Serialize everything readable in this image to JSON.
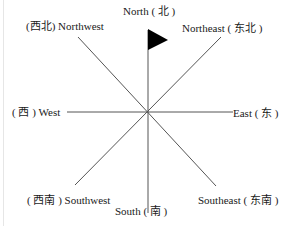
{
  "diagram": {
    "center": [
      147,
      112
    ],
    "line_color": "#555555",
    "flag_color": "#000000",
    "directions": {
      "north": "North ( 北 )",
      "northeast": "Northeast ( 东北 )",
      "east": "East ( 东 )",
      "southeast": "Southeast ( 东南 )",
      "south": "South ( 南 )",
      "southwest": "( 西南 ) Southwest",
      "west": "( 西 ) West",
      "northwest": "(西北) Northwest"
    }
  }
}
